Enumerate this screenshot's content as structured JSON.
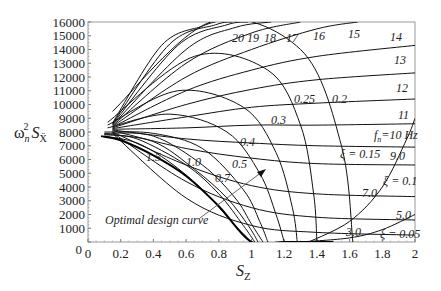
{
  "chart_data": {
    "type": "line",
    "title": "",
    "xlabel": "S_Z",
    "ylabel": "ω_n² S_Ẍ",
    "xlim": [
      0,
      2
    ],
    "ylim": [
      0,
      16000
    ],
    "grid": false,
    "x_ticks": [
      "0",
      "0.2",
      "0.4",
      "0.6",
      "0.8",
      "1",
      "1.2",
      "1.4",
      "1.6",
      "1.8",
      "2"
    ],
    "y_ticks": [
      "0",
      "1000",
      "2000",
      "3000",
      "4000",
      "5000",
      "6000",
      "7000",
      "8000",
      "9000",
      "10000",
      "11000",
      "12000",
      "13000",
      "14000",
      "15000",
      "16000"
    ],
    "frequency_lines": {
      "description": "Constant natural-frequency lines f_n (Hz)",
      "labels": [
        "3.0",
        "5.0",
        "7.0",
        "9.0",
        "f_n=10 Hz",
        "11",
        "12",
        "13",
        "14",
        "15",
        "16",
        "17",
        "18",
        "19",
        "20"
      ],
      "series": [
        {
          "name": "3.0",
          "x": [
            0.15,
            0.6,
            1.0,
            1.4,
            2.0
          ],
          "y": [
            7900,
            3200,
            1200,
            700,
            500
          ]
        },
        {
          "name": "5.0",
          "x": [
            0.15,
            0.6,
            1.0,
            1.4,
            2.0
          ],
          "y": [
            7950,
            4400,
            2500,
            1800,
            1600
          ]
        },
        {
          "name": "7.0",
          "x": [
            0.15,
            0.6,
            1.0,
            1.4,
            2.0
          ],
          "y": [
            8000,
            5600,
            4100,
            3500,
            3300
          ]
        },
        {
          "name": "9.0",
          "x": [
            0.15,
            0.6,
            1.0,
            1.4,
            2.0
          ],
          "y": [
            8100,
            6800,
            6100,
            5700,
            5600
          ]
        },
        {
          "name": "10",
          "x": [
            0.15,
            0.6,
            1.0,
            1.4,
            2.0
          ],
          "y": [
            8150,
            7500,
            7200,
            7000,
            6900
          ]
        },
        {
          "name": "11",
          "x": [
            0.15,
            0.6,
            1.0,
            1.4,
            2.0
          ],
          "y": [
            8200,
            8300,
            8500,
            8500,
            8600
          ]
        },
        {
          "name": "12",
          "x": [
            0.15,
            0.6,
            1.0,
            1.4,
            2.0
          ],
          "y": [
            8250,
            9100,
            9800,
            10100,
            10400
          ]
        },
        {
          "name": "13",
          "x": [
            0.15,
            0.6,
            1.0,
            1.4,
            2.0
          ],
          "y": [
            8300,
            10000,
            11100,
            11800,
            12300
          ]
        },
        {
          "name": "14",
          "x": [
            0.15,
            0.6,
            1.0,
            1.4,
            2.0
          ],
          "y": [
            8350,
            11000,
            12500,
            13500,
            14300
          ]
        },
        {
          "name": "15",
          "x": [
            0.15,
            0.6,
            1.0,
            1.4,
            1.65
          ],
          "y": [
            8400,
            12000,
            14000,
            15500,
            16000
          ]
        },
        {
          "name": "16",
          "x": [
            0.15,
            0.6,
            1.0,
            1.3
          ],
          "y": [
            8450,
            13000,
            15200,
            16000
          ]
        },
        {
          "name": "17",
          "x": [
            0.15,
            0.6,
            0.9,
            1.12
          ],
          "y": [
            8500,
            14000,
            15600,
            16000
          ]
        },
        {
          "name": "18",
          "x": [
            0.15,
            0.55,
            0.85,
            0.98
          ],
          "y": [
            8550,
            14300,
            15800,
            16000
          ]
        },
        {
          "name": "19",
          "x": [
            0.15,
            0.5,
            0.78,
            0.88
          ],
          "y": [
            8600,
            14400,
            15800,
            16000
          ]
        },
        {
          "name": "20",
          "x": [
            0.15,
            0.45,
            0.7,
            0.78
          ],
          "y": [
            8650,
            14300,
            15700,
            16000
          ]
        }
      ]
    },
    "damping_curves": {
      "description": "Constant damping-ratio curves ξ",
      "labels": [
        "1.5",
        "1.0",
        "0.7",
        "0.5",
        "0.4",
        "0.3",
        "0.25",
        "0.2",
        "ξ = 0.15",
        "ξ = 0.1",
        "ξ = 0.05"
      ],
      "series": [
        {
          "name": "1.5",
          "x": [
            0.1,
            0.3,
            0.5,
            0.7,
            0.9,
            1.0
          ],
          "y": [
            7700,
            7200,
            5800,
            3800,
            1200,
            0
          ]
        },
        {
          "name": "1.0",
          "x": [
            0.1,
            0.3,
            0.6,
            0.8,
            0.95,
            1.02
          ],
          "y": [
            7800,
            7500,
            5600,
            3500,
            1200,
            0
          ]
        },
        {
          "name": "0.7",
          "x": [
            0.1,
            0.4,
            0.65,
            0.85,
            0.98,
            1.04
          ],
          "y": [
            7850,
            7300,
            5300,
            3200,
            1200,
            0
          ]
        },
        {
          "name": "0.5",
          "x": [
            0.1,
            0.4,
            0.7,
            0.9,
            1.0,
            1.07
          ],
          "y": [
            7900,
            7700,
            5600,
            3200,
            1300,
            0
          ]
        },
        {
          "name": "0.4",
          "x": [
            0.1,
            0.4,
            0.7,
            0.95,
            1.05,
            1.1
          ],
          "y": [
            8000,
            7900,
            6800,
            3800,
            1500,
            0
          ]
        },
        {
          "name": "0.3",
          "x": [
            0.12,
            0.5,
            0.85,
            1.05,
            1.15,
            1.2
          ],
          "y": [
            8300,
            9300,
            8000,
            5000,
            2000,
            0
          ]
        },
        {
          "name": "0.25",
          "x": [
            0.12,
            0.55,
            0.95,
            1.15,
            1.25,
            1.28
          ],
          "y": [
            8500,
            11000,
            9800,
            6500,
            2500,
            0
          ]
        },
        {
          "name": "0.2",
          "x": [
            0.12,
            0.65,
            1.1,
            1.3,
            1.38,
            1.4
          ],
          "y": [
            8700,
            13500,
            12500,
            8500,
            3500,
            0
          ]
        },
        {
          "name": "0.15",
          "x": [
            0.15,
            0.75,
            1.3,
            1.55,
            1.62
          ],
          "y": [
            9500,
            16000,
            14000,
            7000,
            0
          ]
        },
        {
          "name": "0.1",
          "x": [
            1.35,
            1.6,
            1.8,
            1.95,
            2.0
          ],
          "y": [
            0,
            1500,
            4000,
            7500,
            9000
          ]
        },
        {
          "name": "0.05",
          "x": [
            1.3,
            1.6,
            1.8,
            2.0
          ],
          "y": [
            0,
            300,
            900,
            2000
          ]
        }
      ]
    },
    "optimal_design_curve": {
      "label": "Optimal design curve",
      "x": [
        0.08,
        0.2,
        0.4,
        0.6,
        0.8,
        1.0,
        1.2,
        1.5
      ],
      "y": [
        7700,
        7400,
        6300,
        4800,
        2600,
        0,
        0,
        0
      ]
    },
    "annotations": [
      {
        "text": "Optimal design curve",
        "x": 0.15,
        "y": 1200,
        "arrow_to": [
          1.07,
          5200
        ]
      }
    ]
  },
  "axes": {
    "y_title_main": "ω",
    "y_title_sub": "n",
    "y_title_sup": "2",
    "y_title_S": "S",
    "y_title_Ssub": "Ẍ",
    "x_title_S": "S",
    "x_title_sub": "Z"
  },
  "labels": {
    "f3": "3.0",
    "f5": "5.0",
    "f7": "7.0",
    "f9": "9.0",
    "f10": "f",
    "f10_sub": "n",
    "f10_rest": "=10 Hz",
    "f11": "11",
    "f12": "12",
    "f13": "13",
    "f14": "14",
    "f15": "15",
    "f16": "16",
    "f17": "17",
    "f18": "18",
    "f19": "19",
    "f20": "20",
    "z15": "1.5",
    "z10": "1.0",
    "z07": "0.7",
    "z05": "0.5",
    "z04": "0.4",
    "z03": "0.3",
    "z025": "0.25",
    "z02": "0.2",
    "z015": "ξ = 0.15",
    "z01": "ξ = 0.1",
    "z005": "ξ = 0.05",
    "optimal": "Optimal design curve"
  }
}
